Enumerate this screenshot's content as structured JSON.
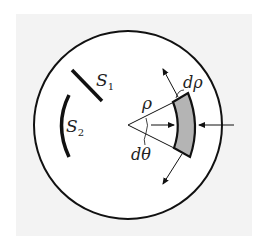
{
  "diagram": {
    "labels": {
      "s1": "S",
      "s1_sub": "1",
      "s2": "S",
      "s2_sub": "2",
      "rho": "ρ",
      "d_rho": "dρ",
      "d_theta": "dθ"
    },
    "colors": {
      "background": "#f3f3f3",
      "circle_fill": "#ffffff",
      "stroke": "#111111",
      "sector_fill": "#b4b4b4"
    }
  }
}
